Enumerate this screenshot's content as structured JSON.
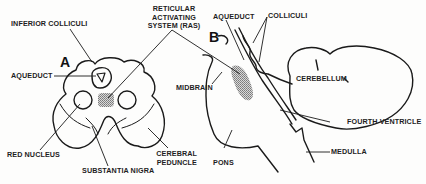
{
  "diagram": {
    "panels": [
      {
        "id": "A",
        "label": "A",
        "view": "cross-section of midbrain"
      },
      {
        "id": "B",
        "label": "B",
        "view": "sagittal section of brainstem"
      }
    ],
    "labels": {
      "inferior_colliculi": "INFERIOR COLLICULI",
      "ras_line1": "RETICULAR",
      "ras_line2": "ACTIVATING",
      "ras_line3": "SYSTEM (RAS)",
      "aqueduct_a": "AQUEDUCT",
      "aqueduct_b": "AQUEDUCT",
      "colliculi": "COLLICULI",
      "cerebellum": "CEREBELLUM",
      "midbrain": "MIDBRAIN",
      "fourth_ventricle": "FOURTH VENTRICLE",
      "red_nucleus": "RED NUCLEUS",
      "cerebral_peduncle_line1": "CEREBRAL",
      "cerebral_peduncle_line2": "PEDUNCLE",
      "substantia_nigra": "SUBSTANTIA NIGRA",
      "pons": "PONS",
      "medulla": "MEDULLA"
    },
    "colors": {
      "stroke": "#1a1a1a",
      "shading": "#9a9a9a",
      "background": "#fdfdfc"
    }
  }
}
